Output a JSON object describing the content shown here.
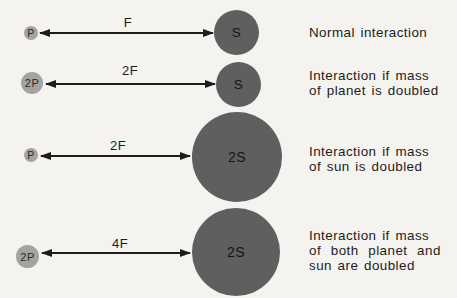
{
  "colors": {
    "background": "#f4f3f0",
    "sun_fill": "#5f5f5f",
    "planet_fill": "#a3a3a1",
    "ink": "#1c1c1c"
  },
  "rows": [
    {
      "planet_label": "P",
      "force_label": "F",
      "sun_label": "S",
      "caption_lines": [
        "Normal interaction"
      ]
    },
    {
      "planet_label": "2P",
      "force_label": "2F",
      "sun_label": "S",
      "caption_lines": [
        "Interaction if mass",
        "of planet is doubled"
      ]
    },
    {
      "planet_label": "P",
      "force_label": "2F",
      "sun_label": "2S",
      "caption_lines": [
        "Interaction if mass",
        "of sun is doubled"
      ]
    },
    {
      "planet_label": "2P",
      "force_label": "4F",
      "sun_label": "2S",
      "caption_lines": [
        "Interaction if mass",
        "of both planet and",
        "sun are doubled"
      ]
    }
  ]
}
